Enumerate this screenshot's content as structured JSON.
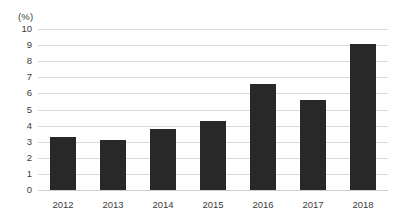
{
  "chart_data": {
    "type": "bar",
    "title": "",
    "subtitle": "",
    "xlabel": "",
    "ylabel": "(%)",
    "unit_label": "(%)",
    "categories": [
      "2012",
      "2013",
      "2014",
      "2015",
      "2016",
      "2017",
      "2018"
    ],
    "values": [
      3.3,
      3.1,
      3.8,
      4.3,
      6.6,
      5.6,
      9.1
    ],
    "series": [
      {
        "name": "",
        "values": [
          3.3,
          3.1,
          3.8,
          4.3,
          6.6,
          5.6,
          9.1
        ]
      }
    ],
    "ylim": [
      0,
      10
    ],
    "yticks": [
      0,
      1,
      2,
      3,
      4,
      5,
      6,
      7,
      8,
      9,
      10
    ],
    "ytick_labels": [
      "0",
      "1",
      "2",
      "3",
      "4",
      "5",
      "6",
      "7",
      "8",
      "9",
      "10"
    ],
    "grid": true,
    "grid_axis": "y",
    "legend": false,
    "legend_position": "none",
    "bar_color": "#282828",
    "grid_color": "#d9d9d9",
    "text_color": "#3b3b3b",
    "background_color": "#ffffff",
    "annotations": []
  }
}
